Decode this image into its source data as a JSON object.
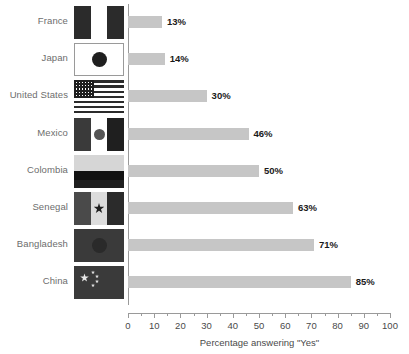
{
  "chart_data": {
    "type": "bar",
    "orientation": "horizontal",
    "title": "",
    "subtitle": "",
    "xlabel": "Percentage answering \"Yes\"",
    "ylabel": "",
    "categories": [
      "France",
      "Japan",
      "United States",
      "Mexico",
      "Colombia",
      "Senegal",
      "Bangladesh",
      "China"
    ],
    "values": [
      13,
      14,
      30,
      46,
      50,
      63,
      71,
      85
    ],
    "value_labels": [
      "13%",
      "14%",
      "30%",
      "46%",
      "50%",
      "63%",
      "71%",
      "85%"
    ],
    "xlim": [
      0,
      100
    ],
    "xticks": [
      0,
      10,
      20,
      30,
      40,
      50,
      60,
      70,
      80,
      90,
      100
    ],
    "xtick_labels": [
      "0",
      "10",
      "20",
      "30",
      "40",
      "50",
      "60",
      "70",
      "80",
      "90",
      "100"
    ],
    "minor_tick_step": 5,
    "grid": false,
    "legend": false,
    "bar_color": "#c6c6c6",
    "axis_color": "#9a9a9a",
    "label_color": "#6d6d6d",
    "value_color": "#1a1a1a"
  },
  "flags": [
    {
      "country": "France",
      "icon": "flag-france-icon",
      "design": "vertical-tricolor",
      "border": "none",
      "bands": [
        "#2b2b2b",
        "#ffffff",
        "#2b2b2b"
      ]
    },
    {
      "country": "Japan",
      "icon": "flag-japan-icon",
      "design": "disc-on-field",
      "border": "#9a9a9a",
      "field": "#ffffff",
      "disc": "#1f1f1f"
    },
    {
      "country": "United States",
      "icon": "flag-united-states-icon",
      "design": "stars-and-stripes",
      "border": "none",
      "stripe_dark": "#2b2b2b",
      "stripe_light": "#ffffff",
      "canton": "#1f1f1f"
    },
    {
      "country": "Mexico",
      "icon": "flag-mexico-icon",
      "design": "vertical-tricolor-emblem",
      "border": "none",
      "bands": [
        "#3a3a3a",
        "#ffffff",
        "#1f1f1f"
      ],
      "emblem": "#555555"
    },
    {
      "country": "Colombia",
      "icon": "flag-colombia-icon",
      "design": "horizontal-tribar",
      "border": "none",
      "bands": [
        "#d6d6d6",
        "#111111",
        "#1f1f1f"
      ]
    },
    {
      "country": "Senegal",
      "icon": "flag-senegal-icon",
      "design": "vertical-tricolor-star",
      "border": "none",
      "bands": [
        "#4a4a4a",
        "#dcdcdc",
        "#2b2b2b"
      ],
      "star": "#1f1f1f"
    },
    {
      "country": "Bangladesh",
      "icon": "flag-bangladesh-icon",
      "design": "disc-on-field",
      "border": "none",
      "field": "#3a3a3a",
      "disc": "#2a2a2a"
    },
    {
      "country": "China",
      "icon": "flag-china-icon",
      "design": "stars-on-field",
      "border": "none",
      "field": "#3a3a3a",
      "star": "#e8e8e8"
    }
  ]
}
